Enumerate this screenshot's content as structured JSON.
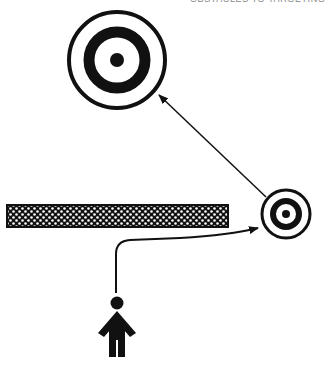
{
  "title": "OBSTACLES TO TARGETING",
  "diagram": {
    "elements": [
      {
        "id": "far-target",
        "type": "bullseye-target",
        "size": "large"
      },
      {
        "id": "near-target",
        "type": "bullseye-target",
        "size": "small"
      },
      {
        "id": "obstacle",
        "type": "hatched-barrier"
      },
      {
        "id": "person",
        "type": "child-figure"
      }
    ],
    "arrows": [
      {
        "from": "person",
        "to": "near-target",
        "path": "curved around obstacle"
      },
      {
        "from": "near-target",
        "to": "far-target",
        "path": "straight"
      }
    ],
    "colors": {
      "ink": "#111111",
      "background": "#ffffff"
    }
  }
}
